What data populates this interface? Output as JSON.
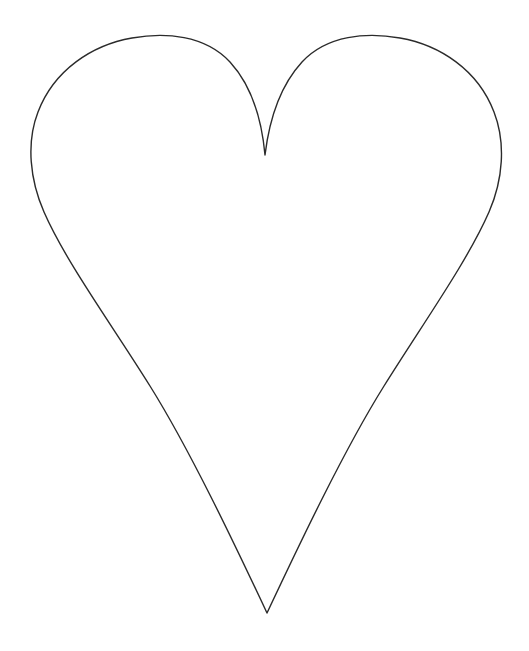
{
  "canvas": {
    "width": 529,
    "height": 651,
    "background_color": "#ffffff",
    "alt_text": "Heart outline"
  },
  "drawing": {
    "name": "heart-outline",
    "type": "line-art",
    "stroke_color": "#2b2b2b",
    "fill_color": "none",
    "stroke_width": 1.4,
    "path": "M 265 155 C 262 122 252 86 230 62 C 205 35 165 32 132 38 C 92 45 54 70 38 112 C 26 143 30 180 44 212 C 66 262 110 322 150 386 C 190 450 235 545 267 613 C 299 545 344 450 384 386 C 424 322 467 262 489 212 C 503 180 506 143 494 112 C 478 70 440 45 400 38 C 367 32 327 35 302 62 C 280 86 269 122 265 155 Z",
    "key_points": {
      "cleft_tip": [
        265,
        155
      ],
      "bottom_vertex": [
        267,
        613
      ],
      "left_extreme": [
        31,
        163
      ],
      "right_extreme": [
        502,
        167
      ],
      "left_lobe_top": [
        147,
        37
      ],
      "right_lobe_top": [
        383,
        38
      ]
    }
  }
}
